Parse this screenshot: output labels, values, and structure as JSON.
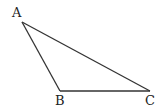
{
  "diagram": {
    "type": "triangle",
    "vertices": [
      {
        "label": "A",
        "x": 22,
        "y": 22,
        "lx": 12,
        "ly": 17
      },
      {
        "label": "B",
        "x": 60,
        "y": 91,
        "lx": 55,
        "ly": 105
      },
      {
        "label": "C",
        "x": 150,
        "y": 91,
        "lx": 145,
        "ly": 105
      }
    ],
    "edges": [
      [
        "A",
        "B"
      ],
      [
        "B",
        "C"
      ],
      [
        "A",
        "C"
      ]
    ]
  }
}
